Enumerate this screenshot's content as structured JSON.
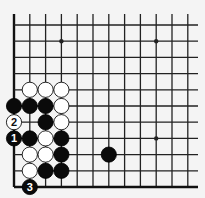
{
  "diagram": {
    "type": "go-board-corner",
    "board": {
      "columns": 12,
      "rows": 11,
      "origin_x": 14,
      "origin_y": 187,
      "spacing_x": 15.8,
      "spacing_y": 16.2,
      "line_top_y": 14,
      "line_right_x": 198,
      "edges": [
        "left",
        "bottom"
      ]
    },
    "colors": {
      "background": "#f4f4f4",
      "line": "#222222",
      "black_stone": "#0a0a0a",
      "white_stone": "#ffffff"
    },
    "star_points": [
      {
        "col": 3,
        "row": 9
      },
      {
        "col": 9,
        "row": 9
      },
      {
        "col": 9,
        "row": 3
      }
    ],
    "stones": [
      {
        "color": "white",
        "col": 1,
        "row": 6
      },
      {
        "color": "white",
        "col": 2,
        "row": 6
      },
      {
        "color": "white",
        "col": 3,
        "row": 6
      },
      {
        "color": "black",
        "col": 0,
        "row": 5
      },
      {
        "color": "black",
        "col": 1,
        "row": 5
      },
      {
        "color": "black",
        "col": 2,
        "row": 5
      },
      {
        "color": "white",
        "col": 3,
        "row": 5
      },
      {
        "color": "white",
        "col": 0,
        "row": 4,
        "label": "2"
      },
      {
        "color": "black",
        "col": 2,
        "row": 4
      },
      {
        "color": "white",
        "col": 3,
        "row": 4
      },
      {
        "color": "black",
        "col": 0,
        "row": 3,
        "label": "1"
      },
      {
        "color": "black",
        "col": 1,
        "row": 3
      },
      {
        "color": "white",
        "col": 2,
        "row": 3
      },
      {
        "color": "black",
        "col": 3,
        "row": 3
      },
      {
        "color": "white",
        "col": 1,
        "row": 2
      },
      {
        "color": "white",
        "col": 2,
        "row": 2
      },
      {
        "color": "black",
        "col": 3,
        "row": 2
      },
      {
        "color": "white",
        "col": 1,
        "row": 1
      },
      {
        "color": "black",
        "col": 2,
        "row": 1
      },
      {
        "color": "black",
        "col": 3,
        "row": 1
      },
      {
        "color": "black",
        "col": 1,
        "row": 0,
        "label": "3"
      },
      {
        "color": "black",
        "col": 6,
        "row": 2
      }
    ],
    "move_labels": [
      "1",
      "2",
      "3"
    ]
  }
}
